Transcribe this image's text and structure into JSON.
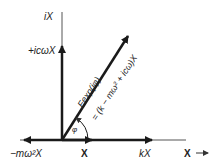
{
  "diagram": {
    "type": "phasor-diagram",
    "labels": {
      "imag_axis": "iX",
      "damping_force": "+icωX",
      "force_vector": "Fexp(iφ)",
      "force_equation": "= (k − mω² + icω)X",
      "angle": "φ",
      "inertia_force": "−mω²X",
      "displacement": "X",
      "spring_force": "kX",
      "real_axis": "X",
      "real_axis_arrow": "→"
    },
    "colors": {
      "line": "#1a1a1a",
      "axis": "#555555",
      "text": "#222222",
      "background": "#ffffff"
    }
  }
}
